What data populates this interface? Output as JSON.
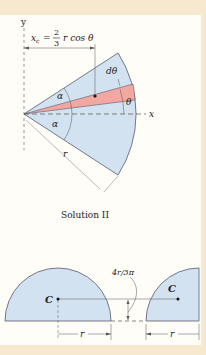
{
  "figure": {
    "top_diagram": {
      "axis_y_label": "y",
      "axis_x_label": "x",
      "equation": {
        "lhs": "x",
        "lhs_sub": "c",
        "equals": "=",
        "frac_num": "2",
        "frac_den": "3",
        "rhs": "r cos θ"
      },
      "labels": {
        "d_theta": "dθ",
        "theta": "θ",
        "alpha_top": "α",
        "alpha_bottom": "α",
        "radius": "r"
      }
    },
    "caption": "Solution II",
    "bottom_diagram": {
      "semicircle_centroid_label": "C",
      "quarter_circle_centroid_label": "C",
      "offset_label": "4r/3π",
      "radius_left": "r",
      "radius_right": "r"
    }
  },
  "colors": {
    "region_fill": "#d3e2f0",
    "strip_fill": "#f2a8a0",
    "outline": "#555a6e",
    "border_bg": "#f7e9cf"
  }
}
